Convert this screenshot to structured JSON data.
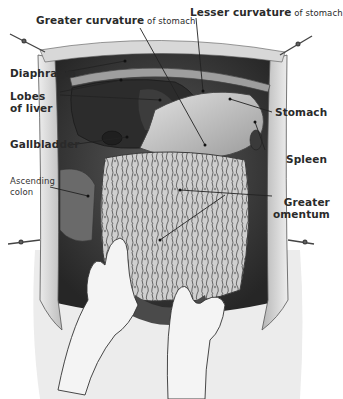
{
  "figure": {
    "style": "grayscale anatomical illustration"
  },
  "labels": {
    "greater_curvature": {
      "bold": "Greater curvature",
      "rest": " of stomach"
    },
    "lesser_curvature": {
      "bold": "Lesser curvature",
      "rest": " of stomach"
    },
    "diaphragm": "Diaphragm",
    "lobes_of_liver": {
      "line1": "Lobes",
      "line2": "of liver"
    },
    "gallbladder": "Gallbladder",
    "ascending_colon": {
      "line1": "Ascending",
      "line2": "colon"
    },
    "stomach": "Stomach",
    "spleen": "Spleen",
    "greater_omentum": {
      "line1": "Greater",
      "line2": "omentum"
    }
  },
  "colors": {
    "background": "#ffffff",
    "skin_flap": "#d9d9d9",
    "cavity": "#3a3a3a",
    "liver": "#2e2e2e",
    "stomach": "#c8c8c8",
    "omentum": "#bdbdbd",
    "glove": "#f2f2f2",
    "label_text": "#2a2a2a"
  }
}
